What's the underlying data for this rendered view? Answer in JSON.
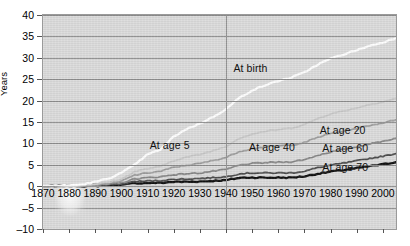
{
  "chart_data": {
    "type": "line",
    "title": "",
    "xlabel": "",
    "ylabel": "Years",
    "xlim": [
      1870,
      2005
    ],
    "ylim": [
      -10,
      40
    ],
    "ytick_labels": [
      "40",
      "35",
      "30",
      "25",
      "20",
      "15",
      "10",
      "5",
      "0",
      "–5",
      "–10"
    ],
    "ytick_values": [
      40,
      35,
      30,
      25,
      20,
      15,
      10,
      5,
      0,
      -5,
      -10
    ],
    "xtick_labels": [
      "1870",
      "1880",
      "1890",
      "1900",
      "1910",
      "1920",
      "1930",
      "1940",
      "1950",
      "1960",
      "1970",
      "1980",
      "1990",
      "2000"
    ],
    "xtick_values": [
      1870,
      1880,
      1890,
      1900,
      1910,
      1920,
      1930,
      1940,
      1950,
      1960,
      1970,
      1980,
      1990,
      2000
    ],
    "grid": "horizontal",
    "legend_position": "inline-annotations",
    "reference_line_x": 1940,
    "annotations": [
      {
        "label": "At birth",
        "x": 1952,
        "y": 27.5
      },
      {
        "label": "At age 5",
        "x": 1920,
        "y": 9.5
      },
      {
        "label": "At age 40",
        "x": 1958,
        "y": 9.0
      },
      {
        "label": "At age 20",
        "x": 1985,
        "y": 13.0
      },
      {
        "label": "At age 60",
        "x": 1986,
        "y": 8.7
      },
      {
        "label": "At age 70",
        "x": 1986,
        "y": 4.2
      }
    ],
    "series": [
      {
        "name": "At birth",
        "color": "#ffffff",
        "x": [
          1870,
          1875,
          1880,
          1885,
          1890,
          1895,
          1900,
          1905,
          1910,
          1915,
          1920,
          1925,
          1930,
          1935,
          1940,
          1945,
          1950,
          1955,
          1960,
          1965,
          1970,
          1975,
          1980,
          1985,
          1990,
          1995,
          2000,
          2005
        ],
        "values": [
          0,
          0.1,
          0.2,
          0.4,
          1.0,
          1.8,
          3.1,
          5.0,
          7.4,
          8.6,
          11.6,
          13.4,
          14.6,
          16.2,
          18.0,
          20.6,
          22.4,
          23.6,
          24.6,
          25.4,
          26.6,
          28.4,
          29.8,
          30.8,
          31.8,
          32.8,
          33.6,
          34.6
        ]
      },
      {
        "name": "At age 5",
        "color": "#c9c9c9",
        "x": [
          1870,
          1875,
          1880,
          1885,
          1890,
          1895,
          1900,
          1905,
          1910,
          1915,
          1920,
          1925,
          1930,
          1935,
          1940,
          1945,
          1950,
          1955,
          1960,
          1965,
          1970,
          1975,
          1980,
          1985,
          1990,
          1995,
          2000,
          2005
        ],
        "values": [
          0,
          0.05,
          0.1,
          0.2,
          0.5,
          0.9,
          1.6,
          3.4,
          4.1,
          4.6,
          6.0,
          6.8,
          7.4,
          8.3,
          9.3,
          11.2,
          12.2,
          12.8,
          13.2,
          13.6,
          14.4,
          15.8,
          16.9,
          17.6,
          18.3,
          19.1,
          19.7,
          20.5
        ]
      },
      {
        "name": "At age 20",
        "color": "#9e9e9e",
        "x": [
          1870,
          1875,
          1880,
          1885,
          1890,
          1895,
          1900,
          1905,
          1910,
          1915,
          1920,
          1925,
          1930,
          1935,
          1940,
          1945,
          1950,
          1955,
          1960,
          1965,
          1970,
          1975,
          1980,
          1985,
          1990,
          1995,
          2000,
          2005
        ],
        "values": [
          0,
          0.05,
          0.1,
          0.15,
          0.4,
          0.7,
          1.2,
          2.6,
          3.1,
          3.5,
          4.4,
          4.9,
          5.3,
          6.0,
          6.7,
          8.1,
          8.8,
          9.2,
          9.4,
          9.6,
          10.2,
          11.4,
          12.3,
          12.9,
          13.5,
          14.2,
          14.8,
          15.5
        ]
      },
      {
        "name": "At age 40",
        "color": "#888888",
        "x": [
          1870,
          1875,
          1880,
          1885,
          1890,
          1895,
          1900,
          1905,
          1910,
          1915,
          1920,
          1925,
          1930,
          1935,
          1940,
          1945,
          1950,
          1955,
          1960,
          1965,
          1970,
          1975,
          1980,
          1985,
          1990,
          1995,
          2000,
          2005
        ],
        "values": [
          0,
          0.03,
          0.06,
          0.1,
          0.25,
          0.45,
          0.8,
          1.7,
          2.0,
          2.2,
          2.7,
          2.9,
          3.1,
          3.5,
          3.9,
          4.9,
          5.3,
          5.5,
          5.6,
          5.7,
          6.2,
          7.2,
          8.0,
          8.6,
          9.2,
          9.9,
          10.5,
          11.2
        ]
      },
      {
        "name": "At age 60",
        "color": "#4d4d4d",
        "x": [
          1870,
          1875,
          1880,
          1885,
          1890,
          1895,
          1900,
          1905,
          1910,
          1915,
          1920,
          1925,
          1930,
          1935,
          1940,
          1945,
          1950,
          1955,
          1960,
          1965,
          1970,
          1975,
          1980,
          1985,
          1990,
          1995,
          2000,
          2005
        ],
        "values": [
          0,
          0.02,
          0.04,
          0.06,
          0.15,
          0.3,
          0.5,
          1.1,
          1.2,
          1.3,
          1.6,
          1.7,
          1.8,
          2.0,
          2.2,
          2.9,
          3.1,
          3.1,
          3.1,
          3.1,
          3.5,
          4.3,
          4.9,
          5.4,
          5.9,
          6.5,
          7.0,
          7.6
        ]
      },
      {
        "name": "At age 70",
        "color": "#111111",
        "x": [
          1870,
          1875,
          1880,
          1885,
          1890,
          1895,
          1900,
          1905,
          1910,
          1915,
          1920,
          1925,
          1930,
          1935,
          1940,
          1945,
          1950,
          1955,
          1960,
          1965,
          1970,
          1975,
          1980,
          1985,
          1990,
          1995,
          2000,
          2005
        ],
        "values": [
          0,
          0.01,
          0.02,
          0.03,
          0.08,
          0.18,
          0.3,
          0.7,
          0.75,
          0.8,
          1.0,
          1.05,
          1.1,
          1.25,
          1.4,
          1.95,
          2.05,
          2.0,
          2.0,
          2.0,
          2.3,
          2.9,
          3.4,
          3.8,
          4.2,
          4.7,
          5.1,
          5.6
        ]
      }
    ]
  }
}
